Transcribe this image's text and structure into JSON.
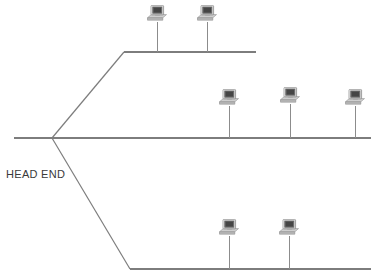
{
  "diagram": {
    "type": "network-topology",
    "canvas": {
      "width": 371,
      "height": 278
    },
    "label": {
      "name": "head-end-label",
      "text": "HEAD END",
      "x": 6,
      "y": 168,
      "font_size": 11,
      "color": "#3a3a3a"
    },
    "colors": {
      "background": "#ffffff",
      "cable_line": "#7d7d7d",
      "drop_line": "#8c8c8c",
      "icon_body": "#b5b5b5",
      "icon_body_light": "#d2d2d2",
      "icon_screen": "#6e6e6e",
      "icon_screen_inner": "#4a4a4a",
      "icon_outline": "#8a8a8a",
      "text": "#3a3a3a"
    },
    "junction": {
      "name": "head-end-junction",
      "x": 52,
      "y": 138
    },
    "trunk": {
      "name": "main-trunk-cable",
      "x1": 14,
      "y1": 138,
      "x2": 371,
      "y2": 138,
      "stroke_width": 1.4
    },
    "branches": [
      {
        "name": "upper-branch",
        "label": "Upper branch",
        "riser": {
          "x1": 52,
          "y1": 138,
          "x2": 124,
          "y2": 52
        },
        "bus": {
          "x1": 124,
          "y1": 52,
          "x2": 256,
          "y2": 52
        },
        "stroke_width": 1.2
      },
      {
        "name": "middle-branch",
        "label": "Middle branch",
        "riser": null,
        "bus": {
          "x1": 52,
          "y1": 138,
          "x2": 371,
          "y2": 138
        },
        "stroke_width": 1.4
      },
      {
        "name": "lower-branch",
        "label": "Lower branch",
        "riser": {
          "x1": 52,
          "y1": 138,
          "x2": 130,
          "y2": 269
        },
        "bus": {
          "x1": 130,
          "y1": 269,
          "x2": 371,
          "y2": 269
        },
        "stroke_width": 1.2
      }
    ],
    "nodes": [
      {
        "name": "workstation-top-1",
        "branch": "upper-branch",
        "stem_x": 157,
        "bus_y": 52,
        "icon_cx": 157,
        "icon_cy": 12,
        "drop_top": 22,
        "drop_bottom": 52
      },
      {
        "name": "workstation-top-2",
        "branch": "upper-branch",
        "stem_x": 207,
        "bus_y": 52,
        "icon_cx": 207,
        "icon_cy": 12,
        "drop_top": 22,
        "drop_bottom": 52
      },
      {
        "name": "workstation-mid-1",
        "branch": "middle-branch",
        "stem_x": 229,
        "bus_y": 138,
        "icon_cx": 229,
        "icon_cy": 96,
        "drop_top": 106,
        "drop_bottom": 138
      },
      {
        "name": "workstation-mid-2",
        "branch": "middle-branch",
        "stem_x": 290,
        "bus_y": 138,
        "icon_cx": 290,
        "icon_cy": 94,
        "drop_top": 104,
        "drop_bottom": 138
      },
      {
        "name": "workstation-mid-3",
        "branch": "middle-branch",
        "stem_x": 355,
        "bus_y": 138,
        "icon_cx": 355,
        "icon_cy": 96,
        "drop_top": 106,
        "drop_bottom": 138
      },
      {
        "name": "workstation-bottom-1",
        "branch": "lower-branch",
        "stem_x": 229,
        "bus_y": 269,
        "icon_cx": 229,
        "icon_cy": 226,
        "drop_top": 236,
        "drop_bottom": 269
      },
      {
        "name": "workstation-bottom-2",
        "branch": "lower-branch",
        "stem_x": 289,
        "bus_y": 269,
        "icon_cx": 289,
        "icon_cy": 226,
        "drop_top": 236,
        "drop_bottom": 269
      }
    ],
    "node_count": 7,
    "icon": {
      "name": "computer-workstation-icon",
      "width": 20,
      "height": 16
    }
  }
}
